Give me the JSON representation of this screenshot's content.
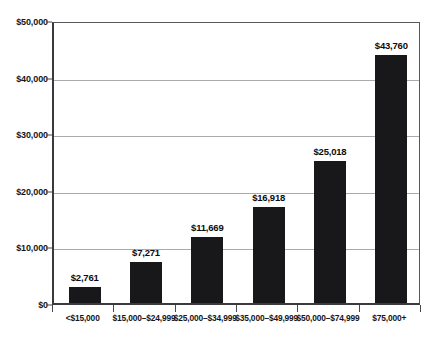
{
  "chart_data": {
    "type": "bar",
    "title": "",
    "xlabel": "",
    "ylabel": "",
    "categories": [
      "<$15,000",
      "$15,000–$24,999",
      "$25,000–$34,999",
      "$35,000–$49,999",
      "$50,000–$74,999",
      "$75,000+"
    ],
    "values": [
      2761,
      7271,
      11669,
      16918,
      25018,
      43760
    ],
    "value_labels": [
      "$2,761",
      "$7,271",
      "$11,669",
      "$16,918",
      "$25,018",
      "$43,760"
    ],
    "ylim": [
      0,
      50000
    ],
    "ytick_values": [
      0,
      10000,
      20000,
      30000,
      40000,
      50000
    ],
    "ytick_labels": [
      "$0",
      "$10,000",
      "$20,000",
      "$30,000",
      "$40,000",
      "$50,000"
    ],
    "grid": true,
    "grid_axis": "y",
    "legend": false,
    "bar_color": "#18181a",
    "grid_color": "#a9a9ae",
    "axis_color": "#3a3a3e",
    "text_color": "#16161a",
    "background": "#ffffff"
  },
  "axis": {
    "y": {
      "ticks": [
        {
          "label": "$50,000",
          "value": 50000
        },
        {
          "label": "$40,000",
          "value": 40000
        },
        {
          "label": "$30,000",
          "value": 30000
        },
        {
          "label": "$20,000",
          "value": 20000
        },
        {
          "label": "$10,000",
          "value": 10000
        },
        {
          "label": "$0",
          "value": 0
        }
      ]
    },
    "x": {
      "ticks": [
        {
          "label": "<$15,000"
        },
        {
          "label": "$15,000–$24,999"
        },
        {
          "label": "$25,000–$34,999"
        },
        {
          "label": "$35,000–$49,999"
        },
        {
          "label": "$50,000–$74,999"
        },
        {
          "label": "$75,000+"
        }
      ]
    }
  },
  "bars": [
    {
      "category": "<$15,000",
      "value": 2761,
      "label": "$2,761"
    },
    {
      "category": "$15,000–$24,999",
      "value": 7271,
      "label": "$7,271"
    },
    {
      "category": "$25,000–$34,999",
      "value": 11669,
      "label": "$11,669"
    },
    {
      "category": "$35,000–$49,999",
      "value": 16918,
      "label": "$16,918"
    },
    {
      "category": "$50,000–$74,999",
      "value": 25018,
      "label": "$25,018"
    },
    {
      "category": "$75,000+",
      "value": 43760,
      "label": "$43,760"
    }
  ],
  "title_remnant": ""
}
